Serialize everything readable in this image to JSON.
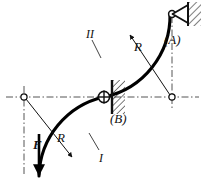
{
  "figure": {
    "type": "engineering-mechanics-diagram",
    "background_color": "#ffffff",
    "line_color": "#111111",
    "bar_color": "#000000",
    "centerline_color": "#555555"
  },
  "labels": {
    "support_a": "(A)",
    "support_b": "(B)",
    "force": "F",
    "radius_upper": "R",
    "radius_lower": "R",
    "segment_lower": "I",
    "segment_upper": "II"
  },
  "icons": {
    "pin_support_a": "triangle-pin-support-icon",
    "pin_support_b": "circle-cross-pin-icon",
    "wall_a": "hatched-wall-icon",
    "wall_b": "hatched-wall-icon",
    "force_arrow": "down-arrow-icon",
    "arc_center_left": "arc-center-icon",
    "arc_center_right": "arc-center-icon"
  },
  "geometry": {
    "arc_radius_label": "R",
    "center_left": {
      "x": 24,
      "y": 97
    },
    "center_right": {
      "x": 172,
      "y": 97
    },
    "point_a": {
      "x": 172,
      "y": 14
    },
    "point_b": {
      "x": 104,
      "y": 97
    },
    "force_point": {
      "x": 39,
      "y": 176
    }
  }
}
